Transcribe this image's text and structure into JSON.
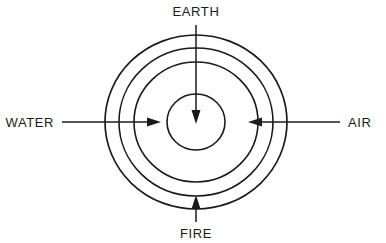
{
  "diagram": {
    "type": "concentric-elements-diagram",
    "background_color": "#ffffff",
    "stroke_color": "#1a1a1a",
    "center": {
      "x": 196,
      "y": 122
    },
    "rings": [
      {
        "name": "outer-ring",
        "rx": 91,
        "ry": 87,
        "stroke_width": 1.7
      },
      {
        "name": "second-ring",
        "rx": 77,
        "ry": 74,
        "stroke_width": 1.6
      },
      {
        "name": "third-ring",
        "rx": 62,
        "ry": 60,
        "stroke_width": 1.6
      },
      {
        "name": "inner-ring",
        "rx": 29,
        "ry": 28,
        "stroke_width": 1.6
      }
    ],
    "labels": {
      "earth": "EARTH",
      "water": "WATER",
      "air": "AIR",
      "fire": "FIRE"
    },
    "arrows": [
      {
        "name": "earth-arrow",
        "label": "EARTH",
        "direction": "down",
        "from": {
          "x": 196,
          "y": 25
        },
        "to": {
          "x": 196,
          "y": 122
        }
      },
      {
        "name": "water-arrow",
        "label": "WATER",
        "direction": "right",
        "from": {
          "x": 62,
          "y": 122
        },
        "to": {
          "x": 160,
          "y": 122
        }
      },
      {
        "name": "air-arrow",
        "label": "AIR",
        "direction": "left",
        "from": {
          "x": 340,
          "y": 122
        },
        "to": {
          "x": 248,
          "y": 122
        }
      },
      {
        "name": "fire-arrow",
        "label": "FIRE",
        "direction": "up",
        "from": {
          "x": 196,
          "y": 222
        },
        "to": {
          "x": 196,
          "y": 196
        }
      }
    ]
  }
}
